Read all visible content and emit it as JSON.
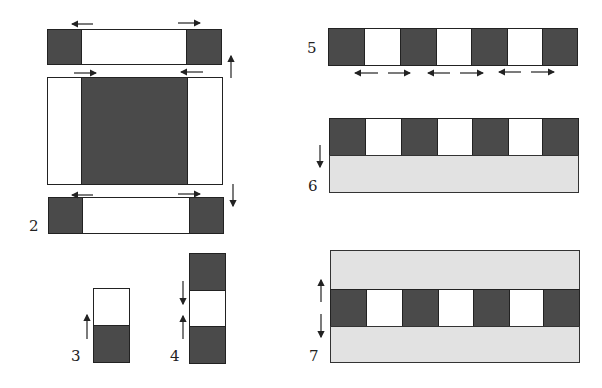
{
  "figure": {
    "panels": [
      {
        "id": "2",
        "label": "2",
        "description": "Top: block with dark ends expands outward; middle: dark core contracts; bottom: dark ends with outward arrows"
      },
      {
        "id": "3",
        "label": "3",
        "description": "Dark bottom segment with upward arrow, white top segment"
      },
      {
        "id": "4",
        "label": "4",
        "description": "Dark top, white middle, dark bottom with converging arrows"
      },
      {
        "id": "5",
        "label": "5",
        "description": "Alternating dark/white strip with double-headed lateral arrows under white segments"
      },
      {
        "id": "6",
        "label": "6",
        "description": "Alternating strip on top of gray layer with downward arrow"
      },
      {
        "id": "7",
        "label": "7",
        "description": "Alternating strip sandwiched between gray layers with up and down arrows"
      }
    ],
    "colors": {
      "dark": "#4a4a4a",
      "light": "#e2e2e2",
      "line": "#222222"
    }
  }
}
